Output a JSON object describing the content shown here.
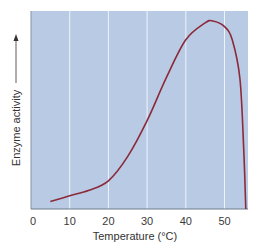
{
  "chart_data": {
    "type": "line",
    "title": "",
    "xlabel": "Temperature (°C)",
    "ylabel": "Enzyme activity",
    "xlim": [
      0,
      56
    ],
    "ylim": [
      0,
      105
    ],
    "x_ticks": [
      "0",
      "10",
      "20",
      "30",
      "40",
      "50"
    ],
    "y_ticks": [],
    "grid": "vertical",
    "legend": null,
    "series": [
      {
        "name": "Enzyme activity",
        "x": [
          5,
          10,
          15,
          20,
          25,
          30,
          35,
          40,
          45,
          47,
          50,
          52,
          54,
          55,
          55.5
        ],
        "values": [
          4,
          7,
          10,
          15,
          28,
          47,
          70,
          90,
          99,
          100,
          97,
          90,
          69,
          30,
          0
        ]
      }
    ]
  },
  "colors": {
    "plot_background": "#b9cae4",
    "gridline": "#eef3fa",
    "curve": "#8b2a3a",
    "axis": "#6d7a8a"
  }
}
